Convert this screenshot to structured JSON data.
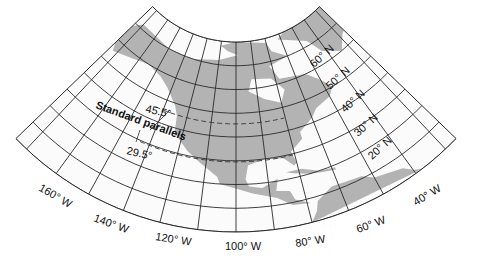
{
  "map": {
    "projection": "Lambert conformal conic",
    "land_color": "#b3b3b3",
    "grid_color": "#2a2a2a",
    "standard_parallels_label": "Standard parallels",
    "standard_parallels": [
      {
        "label": "45.5°",
        "value": 45.5
      },
      {
        "label": "29.5°",
        "value": 29.5
      }
    ],
    "latitude_labels": [
      {
        "label": "60° N",
        "value": 60
      },
      {
        "label": "50° N",
        "value": 50
      },
      {
        "label": "40° N",
        "value": 40
      },
      {
        "label": "30° N",
        "value": 30
      },
      {
        "label": "20° N",
        "value": 20
      }
    ],
    "longitude_labels": [
      {
        "label": "160° W",
        "value": -160
      },
      {
        "label": "140° W",
        "value": -140
      },
      {
        "label": "120° W",
        "value": -120
      },
      {
        "label": "100° W",
        "value": -100
      },
      {
        "label": "80° W",
        "value": -80
      },
      {
        "label": "60° W",
        "value": -60
      },
      {
        "label": "40° W",
        "value": -40
      }
    ]
  }
}
